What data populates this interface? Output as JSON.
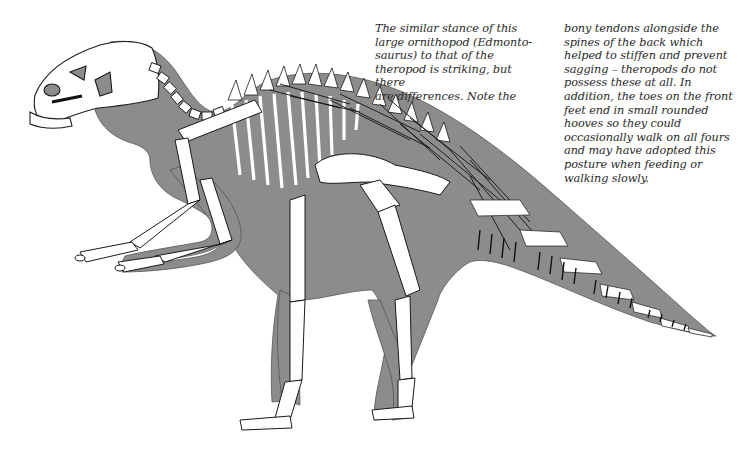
{
  "figure": {
    "colors": {
      "body_silhouette": "#8c8c8c",
      "bone": "#ffffff",
      "outline": "#1a1a1a",
      "tendons": "#111111",
      "text": "#2a2a2a",
      "background": "#ffffff"
    }
  },
  "captions": {
    "left": "The similar stance of this\nlarge ornithopod (Edmonto-\nsaurus) to that of the\ntheropod is striking, but there\nare differences. Note the",
    "right": "bony tendons alongside the\nspines of the back which\nhelped to stiffen and prevent\nsagging – theropods do not\npossess these at all. In\naddition, the toes on the front\nfeet end in small rounded\nhooves so they could\noccasionally walk on all fours\nand may have adopted this\nposture when feeding or\nwalking slowly."
  }
}
